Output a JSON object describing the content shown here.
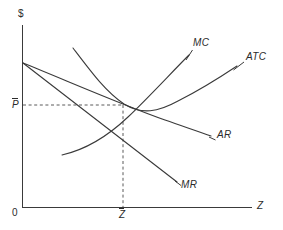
{
  "figure": {
    "type": "economics-diagram",
    "background_color": "#ffffff",
    "line_color": "#3a3a3a",
    "guide_color": "#5a5a5a"
  },
  "axes": {
    "y_axis_label": "$",
    "x_axis_label": "Z",
    "origin_label": "0",
    "y_axis": {
      "x": 22,
      "top": 25,
      "bottom": 207
    },
    "x_axis": {
      "y": 207,
      "left": 22,
      "right": 252
    }
  },
  "markers": {
    "price_label": "P",
    "price_overbar": true,
    "price_y": 105,
    "quantity_label": "Z",
    "quantity_overbar": true,
    "quantity_x": 123,
    "equilibrium_point": {
      "x": 123,
      "y": 105
    }
  },
  "curves": [
    {
      "id": "mc",
      "label": "MC",
      "kind": "marginal-cost",
      "path": "M 62 155 C 84 150, 108 136, 128 117 C 148 98, 172 72, 189 55",
      "label_x": 193,
      "label_y": 43,
      "leader": "M 186 60 L 193 50"
    },
    {
      "id": "atc",
      "label": "ATC",
      "kind": "average-total-cost",
      "path": "M 73 48 C 92 73, 106 92, 124 104 C 142 115, 158 112, 178 101 C 200 90, 222 76, 237 66",
      "label_x": 246,
      "label_y": 57,
      "leader": "M 233 70 L 244 62"
    },
    {
      "id": "ar",
      "label": "AR",
      "kind": "average-revenue-demand",
      "path": "M 23 63 C 70 82, 120 104, 165 120 C 185 127, 200 132, 211 136",
      "label_x": 217,
      "label_y": 135,
      "leader": "M 209 137 L 216 140"
    },
    {
      "id": "mr",
      "label": "MR",
      "kind": "marginal-revenue",
      "path": "M 23 63 L 177 182",
      "label_x": 181,
      "label_y": 181,
      "leader": "M 175 181 L 181 185"
    }
  ],
  "guides": [
    {
      "id": "price-guide",
      "orientation": "horizontal",
      "path": "M 23 105 L 123 105"
    },
    {
      "id": "quantity-guide",
      "orientation": "vertical",
      "path": "M 123 105 L 123 207"
    }
  ]
}
